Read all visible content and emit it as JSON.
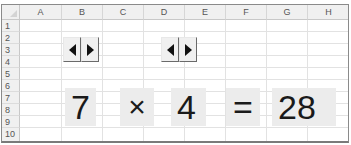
{
  "sheet": {
    "columns": [
      "A",
      "B",
      "C",
      "D",
      "E",
      "F",
      "G",
      "H"
    ],
    "rows": [
      "1",
      "2",
      "3",
      "4",
      "5",
      "6",
      "7",
      "8",
      "9",
      "10"
    ]
  },
  "spinners": [
    {
      "name": "spinner-multiplicand",
      "left_icon": "arrow-left-icon",
      "right_icon": "arrow-right-icon"
    },
    {
      "name": "spinner-multiplier",
      "left_icon": "arrow-left-icon",
      "right_icon": "arrow-right-icon"
    }
  ],
  "equation": {
    "operand1": "7",
    "operator": "×",
    "operand2": "4",
    "equals": "=",
    "result": "28"
  },
  "colors": {
    "cell_fill": "#ececec",
    "header_fill": "#f0f0f0",
    "grid_line": "#e2e2e2",
    "text": "#1a1a1a"
  }
}
